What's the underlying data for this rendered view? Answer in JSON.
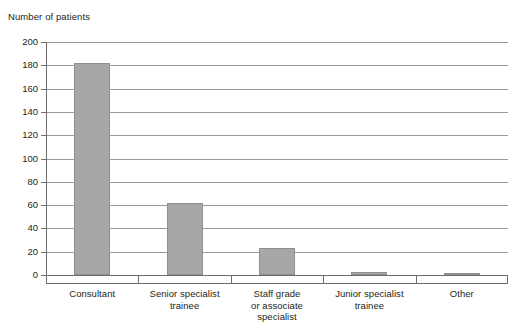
{
  "chart_data": {
    "type": "bar",
    "title": "",
    "xlabel": "",
    "ylabel": "Number of patients",
    "categories": [
      "Consultant",
      "Senior specialist trainee",
      "Staff grade or associate specialist",
      "Junior specialist trainee",
      "Other"
    ],
    "category_lines": [
      [
        "Consultant"
      ],
      [
        "Senior specialist",
        "trainee"
      ],
      [
        "Staff grade",
        "or associate",
        "specialist"
      ],
      [
        "Junior specialist",
        "trainee"
      ],
      [
        "Other"
      ]
    ],
    "values": [
      182,
      62,
      23,
      3,
      2
    ],
    "ylim": [
      0,
      200
    ],
    "ytick_step": 20,
    "yticks": [
      0,
      20,
      40,
      60,
      80,
      100,
      120,
      140,
      160,
      180,
      200
    ],
    "ytick_labels": [
      "0",
      "20",
      "40",
      "60",
      "80",
      "100",
      "120",
      "140",
      "160",
      "180",
      "200"
    ],
    "grid": true,
    "legend": "none",
    "bar_color": "#a7a7a7",
    "bar_edge_color": "#8f8f8f",
    "axis_color": "#6e6e6e",
    "gridline_color": "#9a9a9a",
    "text_color": "#231f20",
    "background": "#ffffff"
  }
}
